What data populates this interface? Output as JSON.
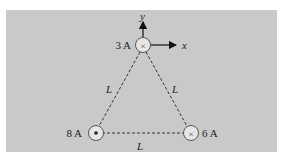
{
  "diagram": {
    "type": "physics-figure",
    "background_color": "#c9c9c9",
    "axes": {
      "y_label": "y",
      "x_label": "x"
    },
    "wires": [
      {
        "id": "top",
        "current_label": "3 A",
        "direction": "into-page",
        "symbol": "×"
      },
      {
        "id": "bottom-left",
        "current_label": "8 A",
        "direction": "out-of-page",
        "symbol": "•"
      },
      {
        "id": "bottom-right",
        "current_label": "6 A",
        "direction": "into-page",
        "symbol": "×"
      }
    ],
    "sides": [
      {
        "id": "left",
        "label": "L"
      },
      {
        "id": "right",
        "label": "L"
      },
      {
        "id": "bottom",
        "label": "L"
      }
    ]
  }
}
